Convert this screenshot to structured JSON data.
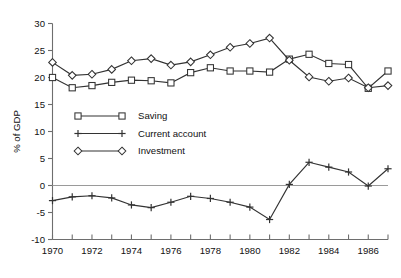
{
  "chart_data": {
    "type": "line",
    "title": "",
    "xlabel": "",
    "ylabel": "% of GDP",
    "xlim": [
      1970,
      1987
    ],
    "ylim": [
      -10,
      30
    ],
    "yticks": [
      -10,
      -5,
      0,
      5,
      10,
      15,
      20,
      25,
      30
    ],
    "ytick_labels": [
      "-10",
      "-5",
      "0",
      "5",
      "10",
      "15",
      "20",
      "25",
      "30"
    ],
    "xticks": [
      1970,
      1971,
      1972,
      1973,
      1974,
      1975,
      1976,
      1977,
      1978,
      1979,
      1980,
      1981,
      1982,
      1983,
      1984,
      1985,
      1986,
      1987
    ],
    "xtick_labels": [
      "1970",
      "",
      "1972",
      "",
      "1974",
      "",
      "1976",
      "",
      "1978",
      "",
      "1980",
      "",
      "1982",
      "",
      "1984",
      "",
      "1986",
      ""
    ],
    "grid": false,
    "zero_line": true,
    "legend_position": "center-left-inside",
    "x": [
      1970,
      1971,
      1972,
      1973,
      1974,
      1975,
      1976,
      1977,
      1978,
      1979,
      1980,
      1981,
      1982,
      1983,
      1984,
      1985,
      1986,
      1987
    ],
    "series": [
      {
        "name": "Saving",
        "marker": "square",
        "values": [
          20.0,
          18.1,
          18.5,
          19.1,
          19.5,
          19.4,
          19.0,
          20.9,
          21.8,
          21.2,
          21.2,
          21.0,
          23.4,
          24.3,
          22.6,
          22.4,
          18.0,
          21.2
        ]
      },
      {
        "name": "Current account",
        "marker": "plus",
        "values": [
          -2.8,
          -2.1,
          -1.9,
          -2.3,
          -3.6,
          -4.1,
          -3.1,
          -2.0,
          -2.4,
          -3.1,
          -4.0,
          -6.3,
          0.2,
          4.3,
          3.4,
          2.5,
          -0.1,
          3.1
        ]
      },
      {
        "name": "Investment",
        "marker": "diamond",
        "values": [
          22.8,
          20.4,
          20.6,
          21.5,
          23.1,
          23.5,
          22.3,
          22.9,
          24.2,
          25.6,
          26.3,
          27.3,
          23.2,
          20.1,
          19.3,
          19.9,
          18.1,
          18.5
        ]
      }
    ],
    "legend": [
      {
        "label": "Saving",
        "marker": "square"
      },
      {
        "label": "Current account",
        "marker": "plus"
      },
      {
        "label": "Investment",
        "marker": "diamond"
      }
    ],
    "colors": {
      "line": "#333333",
      "axis": "#6e6e6e",
      "zero_line": "#9a9a9a",
      "marker_fill": "#ffffff",
      "text": "#111111",
      "background": "#ffffff"
    }
  }
}
